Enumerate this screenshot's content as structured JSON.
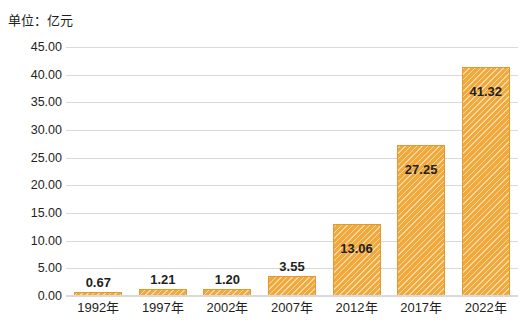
{
  "unit_label": "单位：亿元",
  "chart_data": {
    "type": "bar",
    "title": "",
    "subtitle": "",
    "unit_note": "单位：亿元",
    "categories": [
      "1992年",
      "1997年",
      "2002年",
      "2007年",
      "2012年",
      "2017年",
      "2022年"
    ],
    "values": [
      0.67,
      1.21,
      1.2,
      3.55,
      13.06,
      27.25,
      41.32
    ],
    "data_labels": [
      "0.67",
      "1.21",
      "1.20",
      "3.55",
      "13.06",
      "27.25",
      "41.32"
    ],
    "xlabel": "",
    "ylabel": "",
    "ylim": [
      0,
      45
    ],
    "ytick_values": [
      0,
      5,
      10,
      15,
      20,
      25,
      30,
      35,
      40,
      45
    ],
    "ytick_labels": [
      "0.00",
      "5.00",
      "10.00",
      "15.00",
      "20.00",
      "25.00",
      "30.00",
      "35.00",
      "40.00",
      "45.00"
    ],
    "grid": true,
    "grid_axis": "y",
    "legend": false,
    "legend_position": "none",
    "series_color": "#f2a93b",
    "grid_color": "#d9d9d9",
    "text_color": "#231f20"
  }
}
